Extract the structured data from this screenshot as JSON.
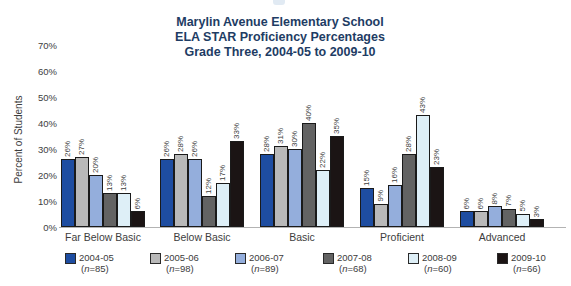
{
  "chart_data": {
    "type": "bar",
    "title_lines": [
      "Marylin Avenue Elementary School",
      "ELA STAR Proficiency Percentages",
      "Grade Three, 2004-05 to 2009-10"
    ],
    "ylabel": "Percent of Students",
    "xlabel": "",
    "ylim": [
      0,
      70
    ],
    "y_tick_step": 10,
    "y_tick_suffix": "%",
    "grid": false,
    "legend_position": "bottom",
    "value_label_suffix": "%",
    "categories": [
      "Far Below Basic",
      "Below Basic",
      "Basic",
      "Proficient",
      "Advanced"
    ],
    "series": [
      {
        "name": "2004-05",
        "n": "85",
        "color": "#1e4da1",
        "values": [
          26,
          26,
          28,
          15,
          6
        ]
      },
      {
        "name": "2005-06",
        "n": "98",
        "color": "#b9b9b9",
        "values": [
          27,
          28,
          31,
          9,
          6
        ]
      },
      {
        "name": "2006-07",
        "n": "89",
        "color": "#94aedc",
        "values": [
          20,
          26,
          30,
          16,
          8
        ]
      },
      {
        "name": "2007-08",
        "n": "68",
        "color": "#636363",
        "values": [
          13,
          12,
          40,
          28,
          7
        ]
      },
      {
        "name": "2008-09",
        "n": "60",
        "color": "#deeff7",
        "values": [
          13,
          17,
          22,
          43,
          5
        ]
      },
      {
        "name": "2009-10",
        "n": "66",
        "color": "#1b1414",
        "values": [
          6,
          33,
          35,
          23,
          3
        ]
      }
    ],
    "colors": {
      "title": "#1e3c64",
      "axis_text": "#3d3d3d",
      "bar_border": "#1a1a1a",
      "baseline": "#b3b3b3"
    }
  }
}
